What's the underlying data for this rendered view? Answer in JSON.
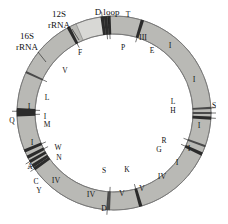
{
  "figure": {
    "title_present": false,
    "geometry": {
      "cx": 114,
      "cy": 113,
      "outer_r": 97,
      "inner_r": 79
    },
    "colors": {
      "light": "#d8d8d5",
      "lighter": "#e2e2df",
      "mid": "#b9b9b5",
      "midgray": "#a8a8a4",
      "dark": "#8d8d89",
      "darker": "#6e6e6b",
      "band": "#2b2b2b",
      "band_soft": "#4a4a4a",
      "outline": "#6f6f6f",
      "text": "#111111",
      "background": "#ffffff"
    }
  },
  "callouts": [
    {
      "name": "d-loop",
      "text": "D loop",
      "x": 107,
      "y": 12,
      "lx1": 108,
      "ly1": 18,
      "lx2": 109,
      "ly2": 24
    },
    {
      "name": "rrna-12s",
      "line1": "12S",
      "line2": "rRNA",
      "x": 59,
      "y": 14,
      "y2": 25,
      "lx1": 72,
      "ly1": 29,
      "lx2": 79,
      "ly2": 40
    },
    {
      "name": "rrna-16s",
      "line1": "16S",
      "line2": "rRNA",
      "x": 27,
      "y": 36,
      "y2": 47,
      "lx1": 38,
      "ly1": 52,
      "lx2": 46,
      "ly2": 62
    }
  ],
  "segments": [
    {
      "name": "d-loop-region",
      "label": "",
      "start": 337,
      "end": 352,
      "fill": "mid",
      "lx": 0,
      "ly": 0
    },
    {
      "name": "control-cap",
      "label": "",
      "start": 352,
      "end": 357,
      "fill": "dark",
      "lx": 0,
      "ly": 0
    },
    {
      "name": "nd3-segment",
      "label": "III",
      "start": 359,
      "end": 375,
      "fill": "light",
      "lx": 0,
      "ly": 0
    },
    {
      "name": "nd1-segment-a",
      "label": "I",
      "start": 379,
      "end": 394,
      "fill": "midgray",
      "lx": 0,
      "ly": 0
    },
    {
      "name": "nd1-segment-b",
      "label": "I",
      "start": 395,
      "end": 425,
      "fill": "midgray",
      "lx": 0,
      "ly": 0
    },
    {
      "name": "nd1-segment-c",
      "label": "I",
      "start": 429,
      "end": 448,
      "fill": "light",
      "lx": 0,
      "ly": 0
    },
    {
      "name": "nd1-segment-d",
      "label": "I",
      "start": 449,
      "end": 462,
      "fill": "light",
      "lx": 0,
      "ly": 0
    },
    {
      "name": "nd1-segment-e",
      "label": "I",
      "start": 464,
      "end": 474,
      "fill": "midgray",
      "lx": 0,
      "ly": 0
    },
    {
      "name": "nd4-segment-a",
      "label": "IV",
      "start": 476,
      "end": 490,
      "fill": "darker",
      "lx": 0,
      "ly": 0
    },
    {
      "name": "nd5-segment-a",
      "label": "V",
      "start": 492,
      "end": 508,
      "fill": "lighter",
      "lx": 0,
      "ly": 0
    },
    {
      "name": "nd5-segment-b",
      "label": "V",
      "start": 509,
      "end": 523,
      "fill": "lighter",
      "lx": 0,
      "ly": 0
    },
    {
      "name": "nd4-segment-b",
      "label": "IV",
      "start": 526,
      "end": 541,
      "fill": "dark",
      "lx": 0,
      "ly": 0
    },
    {
      "name": "nd4-segment-c",
      "label": "IV",
      "start": 546,
      "end": 592,
      "fill": "dark",
      "lx": 0,
      "ly": 0
    },
    {
      "name": "nd1-segment-f",
      "label": "I",
      "start": 601,
      "end": 628,
      "fill": "light",
      "lx": 0,
      "ly": 0
    },
    {
      "name": "nd1-segment-g",
      "label": "I",
      "start": 633,
      "end": 653,
      "fill": "light",
      "lx": 0,
      "ly": 0
    },
    {
      "name": "rrna-16s-seg",
      "label": "",
      "start": 659,
      "end": 690,
      "fill": "lighter",
      "lx": 0,
      "ly": 0
    },
    {
      "name": "rrna-12s-seg",
      "label": "",
      "start": 694,
      "end": 713,
      "fill": "light",
      "lx": 0,
      "ly": 0
    },
    {
      "name": "dloop-seg",
      "label": "",
      "start": 716,
      "end": 697,
      "fill": "mid",
      "lx": 0,
      "ly": 0
    }
  ],
  "trna_markers": [
    {
      "name": "trna-t",
      "letter": "T",
      "angle": 353,
      "side": "outside",
      "dark": true
    },
    {
      "name": "trna-p",
      "letter": "P",
      "angle": 357,
      "side": "inside",
      "dark": true
    },
    {
      "name": "trna-e",
      "letter": "E",
      "angle": 377,
      "side": "inside",
      "dark": true
    },
    {
      "name": "trna-l-right",
      "letter": "L",
      "angle": 447,
      "side": "left-out",
      "dark": false
    },
    {
      "name": "trna-s-right",
      "letter": "S",
      "angle": 450,
      "side": "right-out",
      "dark": false
    },
    {
      "name": "trna-h-right",
      "letter": "H",
      "angle": 453,
      "side": "left-out",
      "dark": true
    },
    {
      "name": "trna-r",
      "letter": "R",
      "angle": 470,
      "side": "inside",
      "dark": false
    },
    {
      "name": "trna-g",
      "letter": "G",
      "angle": 475,
      "side": "inside",
      "dark": true
    },
    {
      "name": "trna-k",
      "letter": "K",
      "angle": 524,
      "side": "inside",
      "dark": true
    },
    {
      "name": "trna-s-bottom",
      "letter": "S",
      "angle": 543,
      "side": "inside",
      "dark": false
    },
    {
      "name": "trna-d",
      "letter": "D",
      "angle": 544,
      "side": "outside",
      "dark": false
    },
    {
      "name": "trna-y",
      "letter": "Y",
      "angle": 595,
      "side": "outside",
      "dark": true
    },
    {
      "name": "trna-c",
      "letter": "C",
      "angle": 597,
      "side": "outside",
      "dark": true
    },
    {
      "name": "trna-a",
      "letter": "A",
      "angle": 600,
      "side": "outside",
      "dark": true
    },
    {
      "name": "trna-n",
      "letter": "N",
      "angle": 603,
      "side": "inside",
      "dark": true
    },
    {
      "name": "trna-w",
      "letter": "W",
      "angle": 607,
      "side": "inside",
      "dark": true
    },
    {
      "name": "trna-m",
      "letter": "M",
      "angle": 629,
      "side": "inside",
      "dark": true
    },
    {
      "name": "trna-i",
      "letter": "I",
      "angle": 632,
      "side": "inside",
      "dark": true
    },
    {
      "name": "trna-q",
      "letter": "Q",
      "angle": 631,
      "side": "outside",
      "dark": true
    },
    {
      "name": "trna-l-left",
      "letter": "L",
      "angle": 655,
      "side": "inside",
      "dark": false
    },
    {
      "name": "trna-v",
      "letter": "V",
      "angle": 692,
      "side": "inside",
      "dark": true
    },
    {
      "name": "trna-f",
      "letter": "F",
      "angle": 715,
      "side": "inside",
      "dark": true
    }
  ],
  "tick_labels": [
    {
      "name": "tick-t",
      "text": "T",
      "x": 128,
      "y": 14
    },
    {
      "name": "tick-p",
      "text": "P",
      "x": 123,
      "y": 47
    },
    {
      "name": "tick-e",
      "text": "E",
      "x": 152,
      "y": 50
    },
    {
      "name": "tick-l1",
      "text": "L",
      "x": 173,
      "y": 101
    },
    {
      "name": "tick-s1",
      "text": "S",
      "x": 214,
      "y": 105
    },
    {
      "name": "tick-h",
      "text": "H",
      "x": 173,
      "y": 110
    },
    {
      "name": "tick-r",
      "text": "R",
      "x": 164,
      "y": 140
    },
    {
      "name": "tick-g",
      "text": "G",
      "x": 159,
      "y": 149
    },
    {
      "name": "tick-k",
      "text": "K",
      "x": 127,
      "y": 169
    },
    {
      "name": "tick-s2",
      "text": "S",
      "x": 104,
      "y": 170
    },
    {
      "name": "tick-d",
      "text": "D",
      "x": 104,
      "y": 208
    },
    {
      "name": "tick-y",
      "text": "Y",
      "x": 39,
      "y": 190
    },
    {
      "name": "tick-c",
      "text": "C",
      "x": 36,
      "y": 181
    },
    {
      "name": "tick-a",
      "text": "A",
      "x": 30,
      "y": 166
    },
    {
      "name": "tick-n",
      "text": "N",
      "x": 59,
      "y": 157
    },
    {
      "name": "tick-w",
      "text": "W",
      "x": 58,
      "y": 147
    },
    {
      "name": "tick-m",
      "text": "M",
      "x": 47,
      "y": 124
    },
    {
      "name": "tick-i",
      "text": "I",
      "x": 45,
      "y": 116
    },
    {
      "name": "tick-q",
      "text": "Q",
      "x": 12,
      "y": 120
    },
    {
      "name": "tick-l2",
      "text": "L",
      "x": 47,
      "y": 97
    },
    {
      "name": "tick-v",
      "text": "V",
      "x": 65,
      "y": 70
    },
    {
      "name": "tick-f",
      "text": "F",
      "x": 80,
      "y": 52
    }
  ],
  "segment_labels": [
    {
      "name": "label-iii",
      "text": "III",
      "x": 143,
      "y": 37
    },
    {
      "name": "label-i-1",
      "text": "I",
      "x": 170,
      "y": 45
    },
    {
      "name": "label-i-2",
      "text": "I",
      "x": 194,
      "y": 79
    },
    {
      "name": "label-i-3",
      "text": "I",
      "x": 199,
      "y": 125
    },
    {
      "name": "label-i-4",
      "text": "I",
      "x": 189,
      "y": 148
    },
    {
      "name": "label-i-5",
      "text": "I",
      "x": 177,
      "y": 162
    },
    {
      "name": "label-iv-1",
      "text": "IV",
      "x": 162,
      "y": 176
    },
    {
      "name": "label-v-1",
      "text": "V",
      "x": 142,
      "y": 188
    },
    {
      "name": "label-v-2",
      "text": "V",
      "x": 122,
      "y": 193
    },
    {
      "name": "label-iv-2",
      "text": "IV",
      "x": 91,
      "y": 194
    },
    {
      "name": "label-iv-3",
      "text": "IV",
      "x": 56,
      "y": 180
    },
    {
      "name": "label-i-6",
      "text": "I",
      "x": 32,
      "y": 142
    },
    {
      "name": "label-i-7",
      "text": "I",
      "x": 29,
      "y": 106
    }
  ]
}
